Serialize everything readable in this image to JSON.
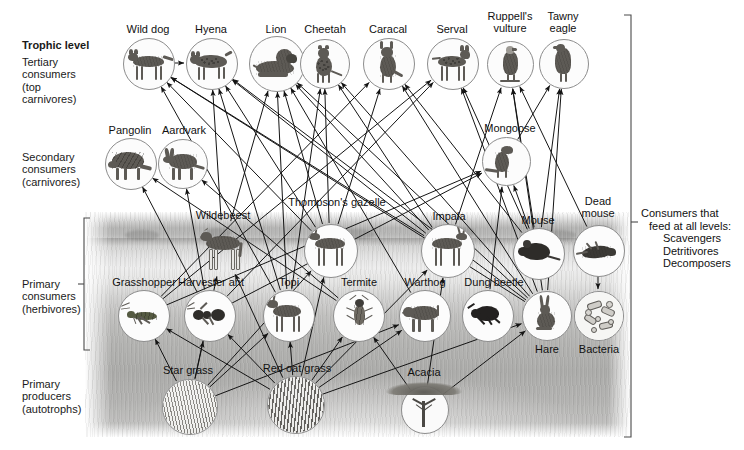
{
  "diagram": {
    "trophic_header": "Trophic level",
    "right_note": {
      "line1": "Consumers that",
      "line2": "feed at all levels:",
      "line3": "Scavengers",
      "line4": "Detritivores",
      "line5": "Decomposers"
    }
  },
  "levels": [
    {
      "id": "tertiary",
      "lines": [
        "Tertiary",
        "consumers",
        "(top",
        "carnivores)"
      ]
    },
    {
      "id": "secondary",
      "lines": [
        "Secondary",
        "consumers",
        "(carnivores)"
      ]
    },
    {
      "id": "primary-consumers",
      "lines": [
        "Primary",
        "consumers",
        "(herbivores)"
      ]
    },
    {
      "id": "primary-producers",
      "lines": [
        "Primary",
        "producers",
        "(autotrophs)"
      ]
    }
  ],
  "organisms": [
    {
      "id": "wild-dog",
      "label": "Wild dog",
      "level": "tertiary"
    },
    {
      "id": "hyena",
      "label": "Hyena",
      "level": "tertiary"
    },
    {
      "id": "lion",
      "label": "Lion",
      "level": "tertiary"
    },
    {
      "id": "cheetah",
      "label": "Cheetah",
      "level": "tertiary"
    },
    {
      "id": "caracal",
      "label": "Caracal",
      "level": "tertiary"
    },
    {
      "id": "serval",
      "label": "Serval",
      "level": "tertiary"
    },
    {
      "id": "ruppells-vulture",
      "label": "Ruppell's vulture",
      "level": "tertiary"
    },
    {
      "id": "tawny-eagle",
      "label": "Tawny eagle",
      "level": "tertiary"
    },
    {
      "id": "pangolin",
      "label": "Pangolin",
      "level": "secondary"
    },
    {
      "id": "aardvark",
      "label": "Aardvark",
      "level": "secondary"
    },
    {
      "id": "mongoose",
      "label": "Mongoose",
      "level": "secondary"
    },
    {
      "id": "wildebeest",
      "label": "Wildebeest",
      "level": "primary-consumers"
    },
    {
      "id": "thompsons-gazelle",
      "label": "Thompson's gazelle",
      "level": "primary-consumers"
    },
    {
      "id": "impala",
      "label": "Impala",
      "level": "primary-consumers"
    },
    {
      "id": "mouse",
      "label": "Mouse",
      "level": "primary-consumers"
    },
    {
      "id": "grasshopper",
      "label": "Grasshopper",
      "level": "primary-consumers"
    },
    {
      "id": "harvester-ant",
      "label": "Harvester ant",
      "level": "primary-consumers"
    },
    {
      "id": "topi",
      "label": "Topi",
      "level": "primary-consumers"
    },
    {
      "id": "termite",
      "label": "Termite",
      "level": "primary-consumers"
    },
    {
      "id": "warthog",
      "label": "Warthog",
      "level": "primary-consumers"
    },
    {
      "id": "dung-beetle",
      "label": "Dung beetle",
      "level": "primary-consumers"
    },
    {
      "id": "hare",
      "label": "Hare",
      "level": "primary-consumers"
    },
    {
      "id": "dead-mouse",
      "label": "Dead mouse",
      "level": "decomposer-chain"
    },
    {
      "id": "bacteria",
      "label": "Bacteria",
      "level": "decomposer-chain"
    },
    {
      "id": "star-grass",
      "label": "Star grass",
      "level": "primary-producers"
    },
    {
      "id": "red-oat-grass",
      "label": "Red oat grass",
      "level": "primary-producers"
    },
    {
      "id": "acacia",
      "label": "Acacia",
      "level": "primary-producers"
    }
  ],
  "chart_data": {
    "type": "diagram",
    "nodes": [
      {
        "id": "wild-dog",
        "label": "Wild dog",
        "x": 148,
        "y": 63,
        "r": 25
      },
      {
        "id": "hyena",
        "label": "Hyena",
        "x": 211,
        "y": 63,
        "r": 25
      },
      {
        "id": "lion",
        "label": "Lion",
        "x": 276,
        "y": 63,
        "r": 27
      },
      {
        "id": "cheetah",
        "label": "Cheetah",
        "x": 324,
        "y": 63,
        "r": 24
      },
      {
        "id": "caracal",
        "label": "Caracal",
        "x": 388,
        "y": 63,
        "r": 25
      },
      {
        "id": "serval",
        "label": "Serval",
        "x": 452,
        "y": 63,
        "r": 25
      },
      {
        "id": "ruppells-vulture",
        "label": "Ruppell's vulture",
        "x": 509,
        "y": 64,
        "r": 23
      },
      {
        "id": "tawny-eagle",
        "label": "Tawny eagle",
        "x": 563,
        "y": 63,
        "r": 24
      },
      {
        "id": "pangolin",
        "label": "Pangolin",
        "x": 130,
        "y": 163,
        "r": 25
      },
      {
        "id": "aardvark",
        "label": "Aardvark",
        "x": 182,
        "y": 163,
        "r": 24
      },
      {
        "id": "mongoose",
        "label": "Mongoose",
        "x": 505,
        "y": 161,
        "r": 24
      },
      {
        "id": "wildebeest",
        "label": "Wildebeest",
        "x": 223,
        "y": 248,
        "r": 27
      },
      {
        "id": "thompsons-gazelle",
        "label": "Thompson's gazelle",
        "x": 330,
        "y": 250,
        "r": 26
      },
      {
        "id": "impala",
        "label": "Impala",
        "x": 447,
        "y": 250,
        "r": 26
      },
      {
        "id": "mouse",
        "label": "Mouse",
        "x": 538,
        "y": 253,
        "r": 25
      },
      {
        "id": "dead-mouse",
        "label": "Dead mouse",
        "x": 598,
        "y": 250,
        "r": 25
      },
      {
        "id": "grasshopper",
        "label": "Grasshopper",
        "x": 143,
        "y": 315,
        "r": 25
      },
      {
        "id": "harvester-ant",
        "label": "Harvester ant",
        "x": 209,
        "y": 315,
        "r": 25
      },
      {
        "id": "topi",
        "label": "Topi",
        "x": 288,
        "y": 315,
        "r": 25
      },
      {
        "id": "termite",
        "label": "Termite",
        "x": 358,
        "y": 315,
        "r": 25
      },
      {
        "id": "warthog",
        "label": "Warthog",
        "x": 424,
        "y": 315,
        "r": 25
      },
      {
        "id": "dung-beetle",
        "label": "Dung beetle",
        "x": 487,
        "y": 315,
        "r": 25
      },
      {
        "id": "hare",
        "label": "Hare",
        "x": 546,
        "y": 315,
        "r": 24
      },
      {
        "id": "bacteria",
        "label": "Bacteria",
        "x": 598,
        "y": 315,
        "r": 24
      },
      {
        "id": "star-grass",
        "label": "Star grass",
        "x": 189,
        "y": 406,
        "r": 27
      },
      {
        "id": "red-oat-grass",
        "label": "Red oat grass",
        "x": 295,
        "y": 404,
        "r": 28
      },
      {
        "id": "acacia",
        "label": "Acacia",
        "x": 424,
        "y": 409,
        "r": 23
      }
    ],
    "edges": [
      [
        "wild-dog",
        "hyena"
      ],
      [
        "cheetah",
        "lion"
      ],
      [
        "thompsons-gazelle",
        "wild-dog"
      ],
      [
        "impala",
        "wild-dog"
      ],
      [
        "topi",
        "wild-dog"
      ],
      [
        "hare",
        "wild-dog"
      ],
      [
        "thompsons-gazelle",
        "hyena"
      ],
      [
        "topi",
        "hyena"
      ],
      [
        "wildebeest",
        "hyena"
      ],
      [
        "impala",
        "hyena"
      ],
      [
        "hare",
        "hyena"
      ],
      [
        "wildebeest",
        "lion"
      ],
      [
        "topi",
        "lion"
      ],
      [
        "warthog",
        "lion"
      ],
      [
        "impala",
        "lion"
      ],
      [
        "thompsons-gazelle",
        "lion"
      ],
      [
        "hare",
        "lion"
      ],
      [
        "thompsons-gazelle",
        "cheetah"
      ],
      [
        "impala",
        "cheetah"
      ],
      [
        "hare",
        "cheetah"
      ],
      [
        "topi",
        "cheetah"
      ],
      [
        "hare",
        "caracal"
      ],
      [
        "mouse",
        "caracal"
      ],
      [
        "grasshopper",
        "caracal"
      ],
      [
        "thompsons-gazelle",
        "caracal"
      ],
      [
        "mouse",
        "serval"
      ],
      [
        "hare",
        "serval"
      ],
      [
        "grasshopper",
        "serval"
      ],
      [
        "harvester-ant",
        "serval"
      ],
      [
        "mouse",
        "ruppells-vulture"
      ],
      [
        "hare",
        "ruppells-vulture"
      ],
      [
        "dead-mouse",
        "ruppells-vulture"
      ],
      [
        "impala",
        "ruppells-vulture"
      ],
      [
        "mongoose",
        "tawny-eagle"
      ],
      [
        "mouse",
        "tawny-eagle"
      ],
      [
        "hare",
        "tawny-eagle"
      ],
      [
        "harvester-ant",
        "pangolin"
      ],
      [
        "termite",
        "pangolin"
      ],
      [
        "harvester-ant",
        "aardvark"
      ],
      [
        "termite",
        "aardvark"
      ],
      [
        "mouse",
        "mongoose"
      ],
      [
        "grasshopper",
        "mongoose"
      ],
      [
        "harvester-ant",
        "mongoose"
      ],
      [
        "dung-beetle",
        "mongoose"
      ],
      [
        "star-grass",
        "wildebeest"
      ],
      [
        "red-oat-grass",
        "wildebeest"
      ],
      [
        "star-grass",
        "thompsons-gazelle"
      ],
      [
        "red-oat-grass",
        "thompsons-gazelle"
      ],
      [
        "red-oat-grass",
        "impala"
      ],
      [
        "acacia",
        "impala"
      ],
      [
        "star-grass",
        "grasshopper"
      ],
      [
        "red-oat-grass",
        "grasshopper"
      ],
      [
        "star-grass",
        "harvester-ant"
      ],
      [
        "red-oat-grass",
        "harvester-ant"
      ],
      [
        "star-grass",
        "topi"
      ],
      [
        "red-oat-grass",
        "topi"
      ],
      [
        "red-oat-grass",
        "termite"
      ],
      [
        "acacia",
        "termite"
      ],
      [
        "red-oat-grass",
        "warthog"
      ],
      [
        "star-grass",
        "warthog"
      ],
      [
        "red-oat-grass",
        "hare"
      ],
      [
        "acacia",
        "hare"
      ],
      [
        "dead-mouse",
        "bacteria"
      ]
    ],
    "brackets": [
      {
        "id": "primary-consumers-bracket",
        "side": "left",
        "y1": 218,
        "y2": 350
      },
      {
        "id": "all-levels-bracket",
        "side": "right",
        "y1": 15,
        "y2": 437
      }
    ]
  }
}
